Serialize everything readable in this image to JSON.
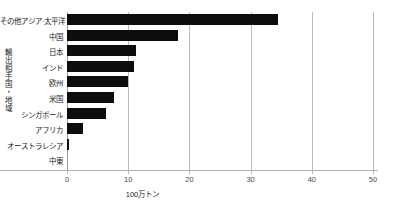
{
  "chart_data": {
    "type": "bar",
    "orientation": "horizontal",
    "title": "",
    "subtitle": "",
    "xlabel": "100万トン",
    "ylabel": "輸出相手国・地域",
    "categories": [
      "その他アジア·太平洋",
      "中国",
      "日本",
      "インド",
      "欧州",
      "米国",
      "シンガポール",
      "アフリカ",
      "オーストラレシア",
      "中東"
    ],
    "values": [
      34.5,
      18.2,
      11.2,
      11.0,
      10.0,
      7.6,
      6.4,
      2.6,
      0.3,
      0.0
    ],
    "xlim": [
      0,
      55
    ],
    "ylim": null,
    "xticks": [
      0,
      10,
      20,
      30,
      40,
      50
    ],
    "xticklabels": [
      "0",
      "10",
      "20",
      "30",
      "40",
      "50"
    ],
    "grid": "vertical",
    "legend": null,
    "bar_color": "#0d0d0d",
    "grid_color": "#b9b9b9",
    "axis_color": "#b3b3b3",
    "background": "#ffffff"
  }
}
